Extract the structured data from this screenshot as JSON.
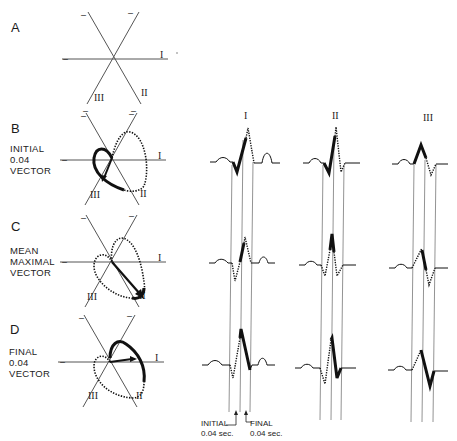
{
  "figure": {
    "panels": [
      {
        "letter": "A",
        "caption": ""
      },
      {
        "letter": "B",
        "caption": "INITIAL\n0.04\nVECTOR"
      },
      {
        "letter": "C",
        "caption": "MEAN\nMAXIMAL\nVECTOR"
      },
      {
        "letter": "D",
        "caption": "FINAL\n0.04\nVECTOR"
      }
    ],
    "axis_labels": {
      "lead1": "I",
      "lead2": "II",
      "lead3": "III",
      "negative": "–"
    },
    "lead_columns": [
      {
        "label": "I"
      },
      {
        "label": "II"
      },
      {
        "label": "III"
      }
    ],
    "footnotes": {
      "initial": "INITIAL\n0.04 sec.",
      "final": "FINAL\n0.04 sec."
    },
    "colors": {
      "ink": "#1a1a1a",
      "guide": "#777777",
      "background": "#ffffff"
    }
  }
}
